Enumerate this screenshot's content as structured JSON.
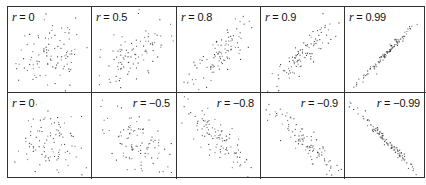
{
  "chart_data": {
    "type": "scatter",
    "title": "",
    "layout": {
      "rows": 2,
      "cols": 5,
      "grid": false,
      "axes_ticks": false,
      "legend": "none"
    },
    "panels": [
      {
        "row": 0,
        "col": 0,
        "label": "r = 0",
        "r": 0,
        "n": 100,
        "label_pos": "left"
      },
      {
        "row": 0,
        "col": 1,
        "label": "r = 0.5",
        "r": 0.5,
        "n": 100,
        "label_pos": "left"
      },
      {
        "row": 0,
        "col": 2,
        "label": "r = 0.8",
        "r": 0.8,
        "n": 100,
        "label_pos": "left"
      },
      {
        "row": 0,
        "col": 3,
        "label": "r = 0.9",
        "r": 0.9,
        "n": 100,
        "label_pos": "left"
      },
      {
        "row": 0,
        "col": 4,
        "label": "r = 0.99",
        "r": 0.99,
        "n": 100,
        "label_pos": "left"
      },
      {
        "row": 1,
        "col": 0,
        "label": "r = 0",
        "r": 0,
        "n": 100,
        "label_pos": "left"
      },
      {
        "row": 1,
        "col": 1,
        "label": "r = −0.5",
        "r": -0.5,
        "n": 100,
        "label_pos": "right"
      },
      {
        "row": 1,
        "col": 2,
        "label": "r = −0.8",
        "r": -0.8,
        "n": 100,
        "label_pos": "right"
      },
      {
        "row": 1,
        "col": 3,
        "label": "r = −0.9",
        "r": -0.9,
        "n": 100,
        "label_pos": "right"
      },
      {
        "row": 1,
        "col": 4,
        "label": "r = −0.99",
        "r": -0.99,
        "n": 100,
        "label_pos": "right"
      }
    ]
  },
  "colors": {
    "border": "#333333",
    "point": "#333333",
    "background": "#ffffff"
  }
}
